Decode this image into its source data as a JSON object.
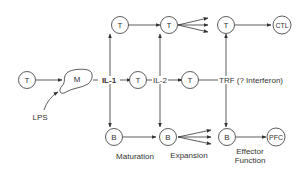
{
  "diagram": {
    "nodes": {
      "t_input": {
        "label": "T"
      },
      "macrophage": {
        "label": "M"
      },
      "t_top1": {
        "label": "T"
      },
      "t_top2": {
        "label": "T"
      },
      "t_top3": {
        "label": "T"
      },
      "ctl": {
        "label": "CTL"
      },
      "t_mid1": {
        "label": "T"
      },
      "t_mid2": {
        "label": "T"
      },
      "b1": {
        "label": "B"
      },
      "b2": {
        "label": "B"
      },
      "b3": {
        "label": "B"
      },
      "pfc": {
        "label": "PFC"
      }
    },
    "labels": {
      "lps": "LPS",
      "il1": "IL-1",
      "il2": "IL-2",
      "trf": "TRF (? Interferon)",
      "maturation": "Maturation",
      "expansion": "Expansion",
      "effector_line1": "Effector",
      "effector_line2": "Function"
    },
    "colors": {
      "stroke": "#333333",
      "background": "#ffffff"
    }
  }
}
